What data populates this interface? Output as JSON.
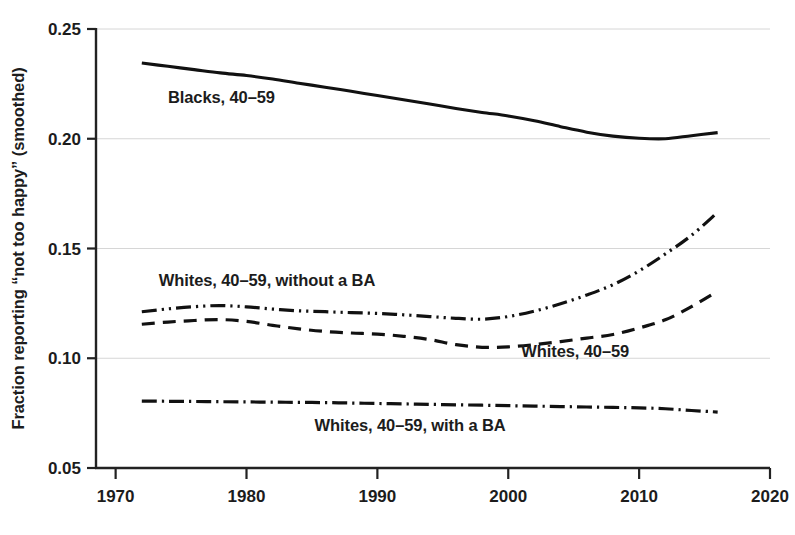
{
  "chart_data": {
    "type": "line",
    "title": "",
    "xlabel": "",
    "ylabel": "Fraction reporting “not too happy” (smoothed)",
    "xlim": [
      1968.5,
      2020
    ],
    "ylim": [
      0.05,
      0.25
    ],
    "xticks": [
      1970,
      1980,
      1990,
      2000,
      2010,
      2020
    ],
    "xtick_labels": [
      "1970",
      "1980",
      "1990",
      "2000",
      "2010",
      "2020"
    ],
    "yticks": [
      0.05,
      0.1,
      0.15,
      0.2,
      0.25
    ],
    "ytick_labels": [
      "0.05",
      "0.10",
      "0.15",
      "0.20",
      "0.25"
    ],
    "grid": true,
    "legend_position": "inline-annotations",
    "series": [
      {
        "name": "Blacks, 40–59",
        "style": "solid",
        "x": [
          1972,
          1974,
          1976,
          1978,
          1980,
          1982,
          1984,
          1986,
          1988,
          1990,
          1992,
          1994,
          1996,
          1998,
          2000,
          2002,
          2004,
          2006,
          2008,
          2010,
          2012,
          2014,
          2016
        ],
        "values": [
          0.2345,
          0.233,
          0.2315,
          0.23,
          0.2288,
          0.2272,
          0.2253,
          0.2235,
          0.2216,
          0.2197,
          0.2178,
          0.2158,
          0.2138,
          0.212,
          0.2104,
          0.2082,
          0.2055,
          0.203,
          0.2012,
          0.2002,
          0.2,
          0.2014,
          0.2028
        ]
      },
      {
        "name": "Whites, 40–59, without a BA",
        "style": "dash-dot-dot",
        "x": [
          1972,
          1974,
          1976,
          1978,
          1980,
          1982,
          1984,
          1986,
          1988,
          1990,
          1992,
          1994,
          1996,
          1998,
          2000,
          2002,
          2004,
          2006,
          2008,
          2010,
          2012,
          2014,
          2016
        ],
        "values": [
          0.1212,
          0.1225,
          0.1235,
          0.124,
          0.1234,
          0.1224,
          0.1216,
          0.1212,
          0.1208,
          0.1204,
          0.1198,
          0.119,
          0.1182,
          0.1178,
          0.119,
          0.1215,
          0.1248,
          0.1288,
          0.1335,
          0.1398,
          0.1475,
          0.156,
          0.1665
        ]
      },
      {
        "name": "Whites, 40–59",
        "style": "dashed",
        "x": [
          1972,
          1974,
          1976,
          1978,
          1980,
          1982,
          1984,
          1986,
          1988,
          1990,
          1992,
          1994,
          1996,
          1998,
          2000,
          2002,
          2004,
          2006,
          2008,
          2010,
          2012,
          2014,
          2016
        ],
        "values": [
          0.1155,
          0.1165,
          0.1172,
          0.1176,
          0.1168,
          0.115,
          0.1134,
          0.1122,
          0.1115,
          0.111,
          0.11,
          0.1085,
          0.1062,
          0.105,
          0.1052,
          0.1062,
          0.1076,
          0.1092,
          0.1108,
          0.1138,
          0.1175,
          0.1235,
          0.1305
        ]
      },
      {
        "name": "Whites, 40–59, with a BA",
        "style": "dash-dot",
        "x": [
          1972,
          1974,
          1976,
          1978,
          1980,
          1982,
          1984,
          1986,
          1988,
          1990,
          1992,
          1994,
          1996,
          1998,
          2000,
          2002,
          2004,
          2006,
          2008,
          2010,
          2012,
          2014,
          2016
        ],
        "values": [
          0.0805,
          0.0804,
          0.0803,
          0.0802,
          0.0801,
          0.08,
          0.0799,
          0.0798,
          0.0796,
          0.0794,
          0.0792,
          0.079,
          0.0788,
          0.0786,
          0.0784,
          0.0782,
          0.078,
          0.0778,
          0.0776,
          0.0774,
          0.077,
          0.0762,
          0.0755
        ]
      }
    ],
    "annotations": [
      {
        "text": "Blacks, 40–59",
        "x": 1974.0,
        "y": 0.2162,
        "anchor": "start"
      },
      {
        "text": "Whites, 40–59, without a BA",
        "x": 1973.3,
        "y": 0.1328,
        "anchor": "start"
      },
      {
        "text": "Whites, 40–59",
        "x": 2001.0,
        "y": 0.1005,
        "anchor": "start"
      },
      {
        "text": "Whites, 40–59, with a BA",
        "x": 1985.2,
        "y": 0.0668,
        "anchor": "start"
      }
    ],
    "colors": {
      "line": "#111111",
      "grid": "#d6d6d6",
      "axis": "#222222",
      "background": "#ffffff",
      "text": "#1c1c1c"
    }
  }
}
